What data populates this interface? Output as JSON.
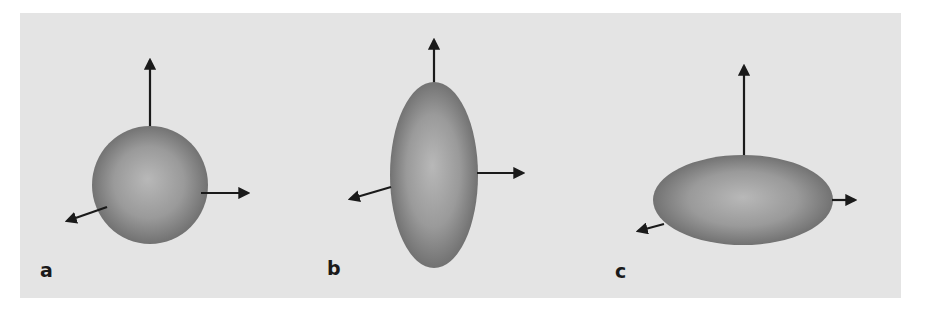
{
  "figure": {
    "background_color": "#e4e4e4",
    "shape_edge_color": "#6a6a6a",
    "shape_center_color": "#b4b4b4",
    "arrow_color": "#1a1a1a",
    "panels": [
      {
        "label": "a",
        "shape": "sphere",
        "center": [
          150,
          185
        ],
        "rx": 58,
        "ry": 59,
        "arrows": [
          {
            "direction": "up",
            "from": [
              150,
              131
            ],
            "to": [
              150,
              57
            ]
          },
          {
            "direction": "right",
            "from": [
              201,
              193
            ],
            "to": [
              251,
              193
            ]
          },
          {
            "direction": "front-left",
            "from": [
              107,
              207
            ],
            "to": [
              64,
              222
            ]
          }
        ]
      },
      {
        "label": "b",
        "shape": "prolate-ellipsoid",
        "center": [
          434,
          175
        ],
        "rx": 44,
        "ry": 93,
        "arrows": [
          {
            "direction": "up",
            "from": [
              434,
              84
            ],
            "to": [
              434,
              37
            ]
          },
          {
            "direction": "right",
            "from": [
              477,
              173
            ],
            "to": [
              526,
              173
            ]
          },
          {
            "direction": "front-left",
            "from": [
              391,
              187
            ],
            "to": [
              347,
              200
            ]
          }
        ]
      },
      {
        "label": "c",
        "shape": "oblate-ellipsoid",
        "center": [
          743,
          200
        ],
        "rx": 90,
        "ry": 45,
        "arrows": [
          {
            "direction": "up",
            "from": [
              744,
              157
            ],
            "to": [
              744,
              63
            ]
          },
          {
            "direction": "right",
            "from": [
              832,
              200
            ],
            "to": [
              858,
              200
            ]
          },
          {
            "direction": "front-left",
            "from": [
              664,
              224
            ],
            "to": [
              635,
              232
            ]
          }
        ]
      }
    ]
  }
}
